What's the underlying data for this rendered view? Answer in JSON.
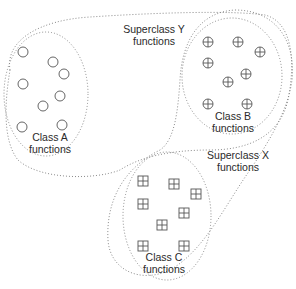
{
  "diagram": {
    "superclasses": [
      {
        "id": "superclass-y",
        "title": "Superclass Y",
        "subtitle": "functions"
      },
      {
        "id": "superclass-x",
        "title": "Superclass X",
        "subtitle": "functions"
      }
    ],
    "classes": [
      {
        "id": "class-a",
        "title": "Class A",
        "subtitle": "functions",
        "symbol": "circle",
        "members": [
          [
            23,
            52
          ],
          [
            53,
            62
          ],
          [
            64,
            74
          ],
          [
            23,
            84
          ],
          [
            60,
            96
          ],
          [
            43,
            106
          ],
          [
            22,
            127
          ],
          [
            62,
            125
          ]
        ]
      },
      {
        "id": "class-b",
        "title": "Class B",
        "subtitle": "functions",
        "symbol": "circled-plus",
        "members": [
          [
            208,
            42
          ],
          [
            238,
            42
          ],
          [
            260,
            52
          ],
          [
            208,
            63
          ],
          [
            246,
            74
          ],
          [
            228,
            82
          ],
          [
            208,
            104
          ],
          [
            247,
            104
          ]
        ]
      },
      {
        "id": "class-c",
        "title": "Class C",
        "subtitle": "functions",
        "symbol": "boxed-plus",
        "members": [
          [
            143,
            181
          ],
          [
            174,
            184
          ],
          [
            196,
            194
          ],
          [
            143,
            204
          ],
          [
            184,
            213
          ],
          [
            162,
            225
          ],
          [
            143,
            246
          ],
          [
            184,
            246
          ]
        ]
      }
    ],
    "colors": {
      "outline": "#8a8a8a",
      "symbol": "#555555",
      "text": "#2a2a2a",
      "background": "#ffffff"
    }
  }
}
